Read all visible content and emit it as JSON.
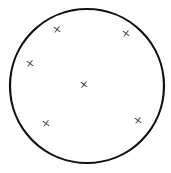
{
  "figure": {
    "canvas": {
      "width": 171,
      "height": 173,
      "background": "#ffffff"
    },
    "shapes": {
      "circle": {
        "name": "boundary-circle",
        "cx": 87,
        "cy": 86,
        "r": 77,
        "stroke_color": "#111111",
        "stroke_width": 2.2,
        "fill_color": "#ffffff"
      }
    },
    "marks": {
      "glyph": "×",
      "count": 6,
      "color": "#1a1a1a",
      "size_px": 15,
      "items": [
        {
          "name": "x-mark-top-left",
          "label": "×",
          "x": 57,
          "y": 30,
          "rotation": -8,
          "size": 15
        },
        {
          "name": "x-mark-top-right",
          "label": "×",
          "x": 126,
          "y": 34,
          "rotation": -8,
          "size": 15
        },
        {
          "name": "x-mark-left",
          "label": "×",
          "x": 30,
          "y": 64,
          "rotation": -8,
          "size": 15
        },
        {
          "name": "x-mark-center",
          "label": "×",
          "x": 84,
          "y": 85,
          "rotation": -6,
          "size": 15
        },
        {
          "name": "x-mark-bottom-left",
          "label": "×",
          "x": 46,
          "y": 124,
          "rotation": -8,
          "size": 15
        },
        {
          "name": "x-mark-bottom-right",
          "label": "×",
          "x": 138,
          "y": 121,
          "rotation": -8,
          "size": 15
        }
      ]
    }
  }
}
